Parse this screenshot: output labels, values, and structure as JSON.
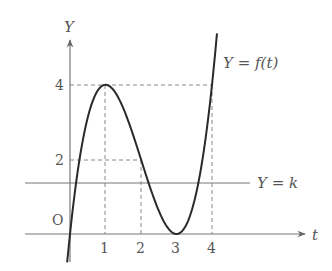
{
  "diagram": {
    "axes": {
      "x_label": "t",
      "y_label": "Y",
      "origin_label": "O",
      "x_ticks": [
        "1",
        "2",
        "3",
        "4"
      ],
      "y_ticks": [
        "2",
        "4"
      ]
    },
    "curve_label": "Y = f(t)",
    "line_label": "Y = k",
    "colors": {
      "curve": "#2a2a2a",
      "axis": "#777777",
      "dashed": "#888888",
      "text": "#555555"
    }
  },
  "chart_data": {
    "type": "line",
    "title": "",
    "xlabel": "t",
    "ylabel": "Y",
    "series": [
      {
        "name": "Y = f(t)",
        "function": "t^3 - 6t^2 + 9t",
        "x": [
          0,
          1,
          2,
          3,
          4
        ],
        "values": [
          0,
          4,
          2,
          0,
          4
        ]
      },
      {
        "name": "Y = k",
        "constant": 1.4
      }
    ],
    "key_points": [
      {
        "t": 1,
        "Y": 4,
        "note": "local maximum"
      },
      {
        "t": 2,
        "Y": 2
      },
      {
        "t": 3,
        "Y": 0,
        "note": "local minimum"
      },
      {
        "t": 4,
        "Y": 4
      }
    ],
    "xlim": [
      -1.3,
      6.8
    ],
    "ylim": [
      -0.5,
      5.5
    ],
    "grid": false
  }
}
